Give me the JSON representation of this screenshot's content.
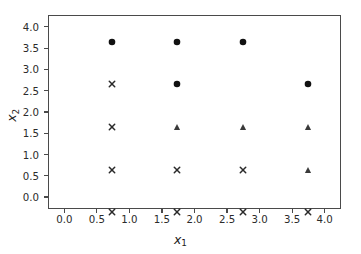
{
  "figure": {
    "background_color": "#ffffff",
    "spine_color": "#4a4a4a",
    "text_color": "#2b2b2b"
  },
  "axes": {
    "xlabel_var": "x",
    "xlabel_sub": "1",
    "ylabel_var": "x",
    "ylabel_sub": "2",
    "x_ticklabels": [
      "0.0",
      "0.5",
      "1.0",
      "1.5",
      "2.0",
      "2.5",
      "3.0",
      "3.5",
      "4.0"
    ],
    "y_ticklabels": [
      "0.0",
      "0.5",
      "1.0",
      "1.5",
      "2.0",
      "2.5",
      "3.0",
      "3.5",
      "4.0"
    ]
  },
  "chart_data": {
    "type": "scatter",
    "title": "",
    "xlabel": "x_1",
    "ylabel": "x_2",
    "xlim": [
      -0.25,
      4.25
    ],
    "ylim": [
      -0.28,
      4.28
    ],
    "xticks": [
      0.0,
      0.5,
      1.0,
      1.5,
      2.0,
      2.5,
      3.0,
      3.5,
      4.0
    ],
    "yticks": [
      0.0,
      0.5,
      1.0,
      1.5,
      2.0,
      2.5,
      3.0,
      3.5,
      4.0
    ],
    "grid": false,
    "legend": false,
    "series": [
      {
        "name": "circle-class",
        "marker": "circle",
        "color": "#111111",
        "size": 7,
        "points": [
          {
            "x": 0,
            "y": 4
          },
          {
            "x": 1,
            "y": 4
          },
          {
            "x": 2,
            "y": 4
          },
          {
            "x": 1,
            "y": 3
          },
          {
            "x": 3,
            "y": 3
          }
        ]
      },
      {
        "name": "triangle-class",
        "marker": "triangle",
        "color": "#3a3a3a",
        "size": 7,
        "points": [
          {
            "x": 1,
            "y": 2
          },
          {
            "x": 2,
            "y": 2
          },
          {
            "x": 3,
            "y": 2
          },
          {
            "x": 4,
            "y": 2
          },
          {
            "x": 3,
            "y": 1
          },
          {
            "x": 4,
            "y": 1
          }
        ]
      },
      {
        "name": "x-class",
        "marker": "x",
        "color": "#2a2a2a",
        "size": 7,
        "points": [
          {
            "x": 0,
            "y": 3
          },
          {
            "x": 0,
            "y": 2
          },
          {
            "x": 0,
            "y": 1
          },
          {
            "x": 1,
            "y": 1
          },
          {
            "x": 2,
            "y": 1
          },
          {
            "x": 0,
            "y": 0
          },
          {
            "x": 1,
            "y": 0
          },
          {
            "x": 2,
            "y": 0
          },
          {
            "x": 3,
            "y": 0
          },
          {
            "x": 4,
            "y": 0
          }
        ]
      }
    ]
  }
}
